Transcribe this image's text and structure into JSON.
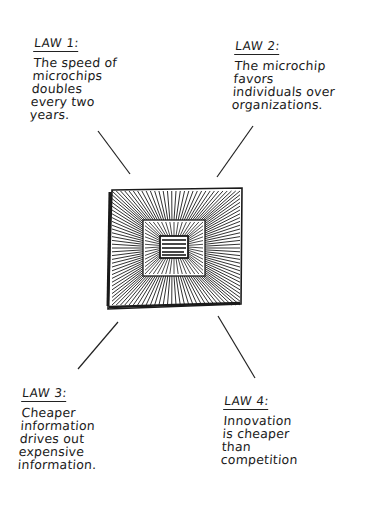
{
  "laws": [
    {
      "title": "LAW 1:",
      "lines": [
        "The speed of",
        "microchips",
        "doubles",
        "every two",
        "years."
      ]
    },
    {
      "title": "LAW 2:",
      "lines": [
        "The microchip",
        "favors",
        "individuals over",
        "organizations."
      ]
    },
    {
      "title": "LAW 3:",
      "lines": [
        "Cheaper",
        "information",
        "drives out",
        "expensive",
        "information."
      ]
    },
    {
      "title": "LAW 4:",
      "lines": [
        "Innovation",
        "is cheaper",
        "than",
        "competition"
      ]
    }
  ],
  "center_graphic": {
    "icon": "microchip-icon",
    "ink_color": "#1a1a1a"
  }
}
